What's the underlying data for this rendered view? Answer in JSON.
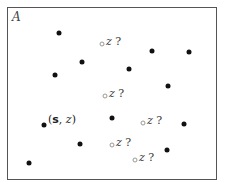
{
  "region": {
    "label": "A"
  },
  "known_label": {
    "open": "(",
    "s": "s",
    "sep": ", ",
    "z": "z",
    "close": ")"
  },
  "query_label": {
    "z": "z",
    "q": " ?"
  },
  "observed_points": [
    {
      "x": 59,
      "y": 33
    },
    {
      "x": 152,
      "y": 51
    },
    {
      "x": 189,
      "y": 52
    },
    {
      "x": 82,
      "y": 62
    },
    {
      "x": 129,
      "y": 69
    },
    {
      "x": 55,
      "y": 75
    },
    {
      "x": 168,
      "y": 86
    },
    {
      "x": 112,
      "y": 118
    },
    {
      "x": 44,
      "y": 125
    },
    {
      "x": 184,
      "y": 124
    },
    {
      "x": 80,
      "y": 144
    },
    {
      "x": 167,
      "y": 150
    },
    {
      "x": 29,
      "y": 163
    }
  ],
  "query_points": [
    {
      "x": 102,
      "y": 44
    },
    {
      "x": 105,
      "y": 96
    },
    {
      "x": 143,
      "y": 123
    },
    {
      "x": 112,
      "y": 145
    },
    {
      "x": 135,
      "y": 160
    }
  ],
  "colors": {
    "observed": "#111111",
    "query": "#999999",
    "frame": "#555555"
  }
}
